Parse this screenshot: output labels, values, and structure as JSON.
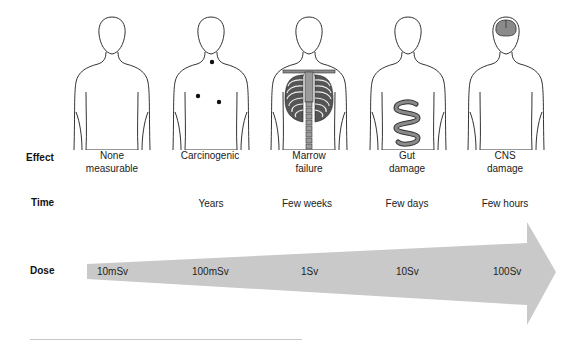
{
  "diagram": {
    "title": "",
    "row_labels": {
      "effect": "Effect",
      "time": "Time",
      "dose": "Dose"
    },
    "columns": [
      {
        "figure": "body-outline",
        "effect_line1": "None",
        "effect_line2": "measurable",
        "time": "",
        "dose": "10mSv"
      },
      {
        "figure": "body-with-tumor-spots",
        "effect_line1": "Carcinogenic",
        "effect_line2": "",
        "time": "Years",
        "dose": "100mSv"
      },
      {
        "figure": "body-with-ribcage-spine",
        "effect_line1": "Marrow",
        "effect_line2": "failure",
        "time": "Few weeks",
        "dose": "1Sv"
      },
      {
        "figure": "body-with-intestine",
        "effect_line1": "Gut",
        "effect_line2": "damage",
        "time": "Few days",
        "dose": "10Sv"
      },
      {
        "figure": "body-with-brain",
        "effect_line1": "CNS",
        "effect_line2": "damage",
        "time": "Few hours",
        "dose": "100Sv"
      }
    ],
    "colors": {
      "arrow_fill": "#c9c9c9",
      "outline": "#333333",
      "organ_fill": "#8a8a8a"
    }
  }
}
